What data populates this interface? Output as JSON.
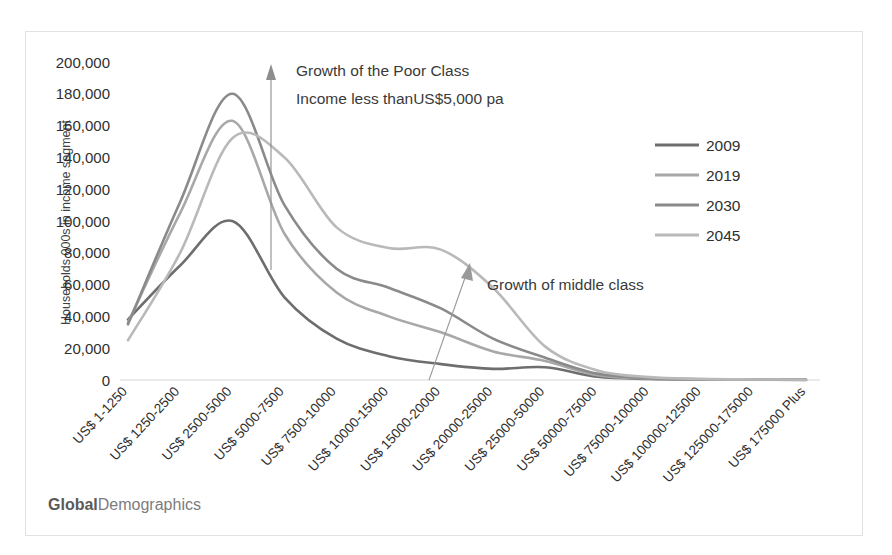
{
  "watermark": {
    "bold_part": "Global",
    "light_part": "Demographics"
  },
  "annotations": {
    "poor_line1": "Growth of the Poor Class",
    "poor_line2": "Income less thanUS$5,000 pa",
    "middle": "Growth of middle class"
  },
  "legend": {
    "position": "right",
    "items": [
      {
        "label": "2009",
        "color": "#6e6e6e"
      },
      {
        "label": "2019",
        "color": "#a8a8a8"
      },
      {
        "label": "2030",
        "color": "#8a8a8a"
      },
      {
        "label": "2045",
        "color": "#b9b9b9"
      }
    ]
  },
  "chart_data": {
    "type": "line",
    "title": "",
    "xlabel": "",
    "ylabel": "Households 000s in income segment",
    "ylim": [
      0,
      200000
    ],
    "yticks": [
      "0",
      "20,000",
      "40,000",
      "60,000",
      "80,000",
      "100,000",
      "120,000",
      "140,000",
      "160,000",
      "180,000",
      "200,000"
    ],
    "ytick_values": [
      0,
      20000,
      40000,
      60000,
      80000,
      100000,
      120000,
      140000,
      160000,
      180000,
      200000
    ],
    "grid": false,
    "legend_position": "right",
    "categories": [
      "US$ 1-1250",
      "US$ 1250-2500",
      "US$ 2500-5000",
      "US$ 5000-7500",
      "US$ 7500-10000",
      "US$ 10000-15000",
      "US$ 15000-20000",
      "US$ 20000-25000",
      "US$ 25000-50000",
      "US$ 50000-75000",
      "US$ 75000-100000",
      "US$ 100000-125000",
      "US$ 125000-175000",
      "US$ 175000 Plus"
    ],
    "series": [
      {
        "name": "2009",
        "color": "#6e6e6e",
        "values": [
          38000,
          72000,
          100000,
          52000,
          26000,
          15000,
          10000,
          7000,
          8000,
          2000,
          700,
          300,
          150,
          100
        ]
      },
      {
        "name": "2019",
        "color": "#a8a8a8",
        "values": [
          36000,
          105000,
          163000,
          92000,
          55000,
          40000,
          30000,
          18000,
          12000,
          3000,
          900,
          400,
          200,
          120
        ]
      },
      {
        "name": "2030",
        "color": "#8a8a8a",
        "values": [
          35000,
          112000,
          180000,
          110000,
          70000,
          58000,
          45000,
          26000,
          14000,
          4000,
          1200,
          500,
          250,
          150
        ]
      },
      {
        "name": "2045",
        "color": "#b9b9b9",
        "values": [
          25000,
          80000,
          152000,
          140000,
          96000,
          83000,
          82000,
          58000,
          21000,
          6000,
          1800,
          700,
          350,
          200
        ]
      }
    ]
  }
}
